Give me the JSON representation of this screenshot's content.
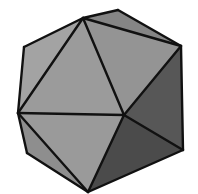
{
  "figure": {
    "background": "#ffffff",
    "edge_color": "#111111",
    "vertices": {
      "A": [
        83,
        18
      ],
      "B": [
        118,
        10
      ],
      "C": [
        181,
        46
      ],
      "D": [
        24,
        47
      ],
      "E": [
        18,
        113
      ],
      "F": [
        124,
        115
      ],
      "G": [
        183,
        150
      ],
      "H": [
        27,
        153
      ],
      "I": [
        88,
        192
      ]
    },
    "faces": [
      {
        "name": "top-sliver-face",
        "v": [
          "A",
          "B",
          "C"
        ],
        "fill": "#858585"
      },
      {
        "name": "upper-left-face",
        "v": [
          "A",
          "D",
          "E"
        ],
        "fill": "#a3a3a3"
      },
      {
        "name": "front-left-face",
        "v": [
          "A",
          "E",
          "F"
        ],
        "fill": "#9b9b9b"
      },
      {
        "name": "front-right-face",
        "v": [
          "A",
          "F",
          "C"
        ],
        "fill": "#949494"
      },
      {
        "name": "right-dark-face",
        "v": [
          "C",
          "F",
          "G"
        ],
        "fill": "#575757"
      },
      {
        "name": "lower-front-face",
        "v": [
          "E",
          "F",
          "I"
        ],
        "fill": "#9a9a9a"
      },
      {
        "name": "lower-left-face",
        "v": [
          "E",
          "H",
          "I"
        ],
        "fill": "#8e8e8e"
      },
      {
        "name": "lower-right-dark-face",
        "v": [
          "F",
          "G",
          "I"
        ],
        "fill": "#4b4b4b"
      }
    ],
    "edges": [
      [
        "A",
        "B"
      ],
      [
        "B",
        "C"
      ],
      [
        "A",
        "C"
      ],
      [
        "A",
        "D"
      ],
      [
        "D",
        "E"
      ],
      [
        "A",
        "E"
      ],
      [
        "A",
        "F"
      ],
      [
        "C",
        "F"
      ],
      [
        "C",
        "G"
      ],
      [
        "E",
        "F"
      ],
      [
        "F",
        "G"
      ],
      [
        "E",
        "H"
      ],
      [
        "H",
        "I"
      ],
      [
        "E",
        "I"
      ],
      [
        "F",
        "I"
      ],
      [
        "G",
        "I"
      ]
    ]
  }
}
